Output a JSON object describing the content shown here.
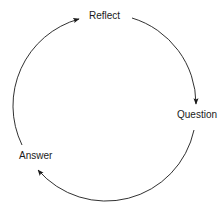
{
  "diagram": {
    "title": "",
    "nodes": [
      {
        "id": "reflect",
        "label": "Reflect"
      },
      {
        "id": "question",
        "label": "Question"
      },
      {
        "id": "answer",
        "label": "Answer"
      }
    ],
    "edges": [
      {
        "from": "reflect",
        "to": "question"
      },
      {
        "from": "question",
        "to": "answer"
      },
      {
        "from": "answer",
        "to": "reflect"
      }
    ],
    "colors": {
      "stroke": "#1a1a1a",
      "background": "#ffffff"
    }
  }
}
